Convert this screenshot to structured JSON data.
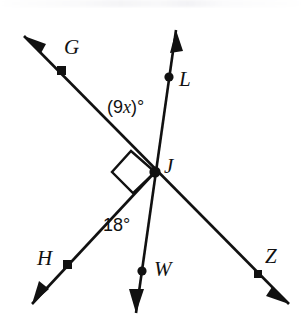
{
  "figure": {
    "type": "geometry-diagram",
    "background_color": "#ffffff",
    "ink_color": "#111111",
    "width": 302,
    "height": 332
  },
  "vertex": {
    "name": "J",
    "label": "J",
    "x": 155,
    "y": 172,
    "label_x": 164,
    "label_y": 156
  },
  "points": [
    {
      "id": "G",
      "label": "G",
      "dot_x": 57,
      "dot_y": 70,
      "label_x": 64,
      "label_y": 37
    },
    {
      "id": "L",
      "label": "L",
      "dot_x": 169,
      "dot_y": 77,
      "label_x": 179,
      "label_y": 69
    },
    {
      "id": "H",
      "label": "H",
      "dot_x": 63,
      "dot_y": 264,
      "label_x": 37,
      "label_y": 248
    },
    {
      "id": "W",
      "label": "W",
      "dot_x": 142,
      "dot_y": 271,
      "label_x": 154,
      "label_y": 259
    },
    {
      "id": "Z",
      "label": "Z",
      "dot_x": 254,
      "dot_y": 274,
      "label_x": 265,
      "label_y": 246
    }
  ],
  "rays": [
    {
      "id": "ray-JG",
      "from": "J",
      "through": "G",
      "tip_x": 24,
      "tip_y": 36,
      "arrow": true
    },
    {
      "id": "ray-JL",
      "from": "J",
      "through": "L",
      "tip_x": 176,
      "tip_y": 30,
      "arrow": true
    },
    {
      "id": "ray-JH",
      "from": "J",
      "through": "H",
      "tip_x": 32,
      "tip_y": 304,
      "arrow": true
    },
    {
      "id": "ray-JW",
      "from": "J",
      "through": "W",
      "tip_x": 136,
      "tip_y": 313,
      "arrow": true
    },
    {
      "id": "ray-JZ",
      "from": "J",
      "through": "Z",
      "tip_x": 289,
      "tip_y": 304,
      "arrow": true
    }
  ],
  "angle_labels": [
    {
      "id": "angle-GJL",
      "text_parts": {
        "open": "(9",
        "variable": "x",
        "close": ")°"
      },
      "plain_text": "(9x)°",
      "between": [
        "G",
        "L"
      ],
      "x": 107,
      "y": 98
    },
    {
      "id": "angle-HJW",
      "plain_text": "18°",
      "between": [
        "H",
        "W"
      ],
      "x": 103,
      "y": 216
    }
  ],
  "right_angle": {
    "id": "right-angle-GJW",
    "measure": "90°",
    "marker": "square",
    "between": [
      "G",
      "W"
    ],
    "path": "M 155 172 L 131 151 L 112 172 L 133 193 Z"
  },
  "geometry_paths": {
    "line_GZ": "M 24 36 L 289 304",
    "line_LW": "M 176 30 L 136 313",
    "line_HJ": "M 32 304 L 155 172"
  },
  "arrow_heads": [
    {
      "id": "arrowhead-G",
      "points": "24,36 46,44 41,53"
    },
    {
      "id": "arrowhead-L",
      "points": "176,30 170,53 183,51"
    },
    {
      "id": "arrowhead-H",
      "points": "32,304 39,281 49,289"
    },
    {
      "id": "arrowhead-W",
      "points": "136,313 129,289 144,289"
    },
    {
      "id": "arrowhead-Z",
      "points": "289,304 266,296 272,287"
    }
  ]
}
